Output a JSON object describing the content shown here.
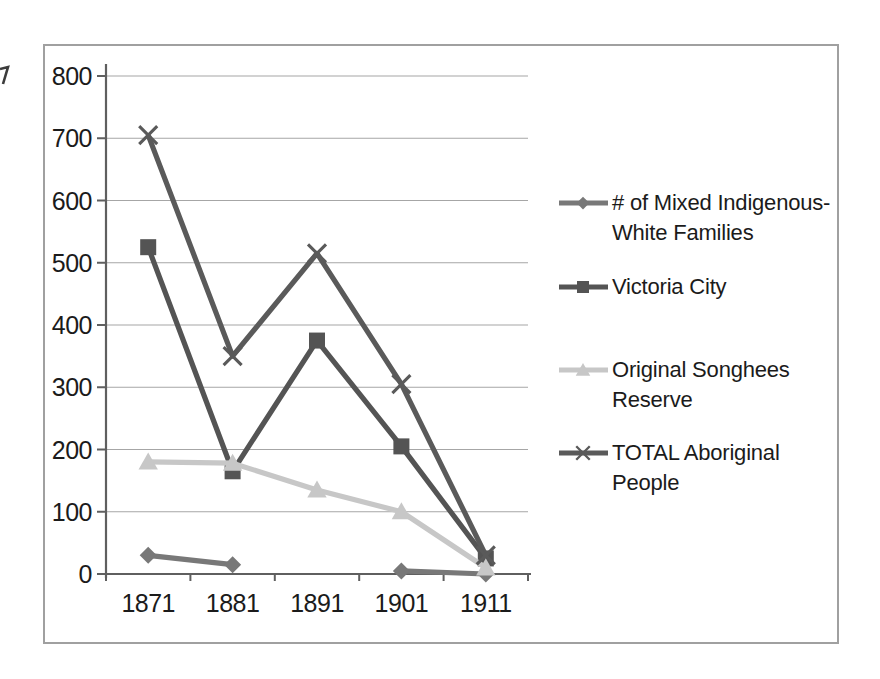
{
  "chart_data": {
    "type": "line",
    "title": "",
    "xlabel": "",
    "ylabel": "",
    "categories": [
      "1871",
      "1881",
      "1891",
      "1901",
      "1911"
    ],
    "series": [
      {
        "name": "# of Mixed Indigenous-White Families",
        "marker": "diamond",
        "color": "#787878",
        "values": [
          30,
          15,
          null,
          5,
          0
        ]
      },
      {
        "name": "Victoria City",
        "marker": "square",
        "color": "#545454",
        "values": [
          525,
          165,
          375,
          205,
          25
        ]
      },
      {
        "name": "Original Songhees Reserve",
        "marker": "triangle",
        "color": "#c7c7c7",
        "values": [
          180,
          178,
          135,
          100,
          10
        ]
      },
      {
        "name": "TOTAL Aboriginal People",
        "marker": "x",
        "color": "#5a5a5a",
        "values": [
          705,
          350,
          515,
          305,
          30
        ]
      }
    ],
    "ylim": [
      0,
      800
    ],
    "ytick_interval": 100,
    "y_tick_labels": [
      "0",
      "100",
      "200",
      "300",
      "400",
      "500",
      "600",
      "700",
      "800"
    ],
    "grid": true,
    "legend_position": "right"
  },
  "style_colors": {
    "background": "#ffffff",
    "frame_border": "#a0a0a0",
    "gridline": "#a6a6a6",
    "axis": "#5f5f5f",
    "text": "#1b1b1b",
    "artifact": "#3c3c3c"
  }
}
